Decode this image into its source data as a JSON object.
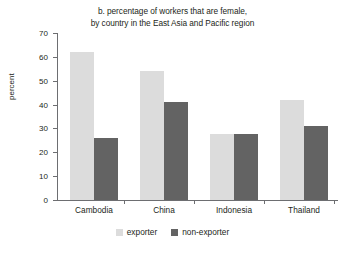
{
  "chart_data": {
    "type": "bar",
    "title": "b. percentage of workers that are female,\nby country in the East Asia and Pacific region",
    "title_lines": [
      "b. percentage of workers that are female,",
      "by country in the East Asia and Pacific region"
    ],
    "xlabel": "",
    "ylabel": "percent",
    "ylim": [
      0,
      70
    ],
    "ytick_step": 10,
    "yticks": [
      0,
      10,
      20,
      30,
      40,
      50,
      60,
      70
    ],
    "ytick_labels": [
      "0",
      "10",
      "20",
      "30",
      "40",
      "50",
      "60",
      "70"
    ],
    "grid": false,
    "legend_position": "bottom-center",
    "categories": [
      "Cambodia",
      "China",
      "Indonesia",
      "Thailand"
    ],
    "series": [
      {
        "name": "exporter",
        "color": "#dcdcdc",
        "values": [
          62,
          54,
          27.5,
          42
        ]
      },
      {
        "name": "non-exporter",
        "color": "#636363",
        "values": [
          26,
          41,
          27.5,
          31
        ]
      }
    ]
  },
  "legend": {
    "items": [
      {
        "label": "exporter"
      },
      {
        "label": "non-exporter"
      }
    ]
  },
  "colors": {
    "exporter": "#dcdcdc",
    "non_exporter": "#636363",
    "axis": "#6d6e71",
    "text": "#231f20",
    "background": "#ffffff"
  }
}
